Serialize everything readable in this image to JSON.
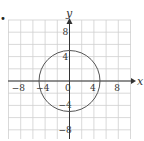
{
  "marker": "•",
  "axes": {
    "x_label": "x",
    "y_label": "y"
  },
  "ticks": {
    "x": [
      {
        "v": -8,
        "label": "−8"
      },
      {
        "v": -4,
        "label": "−4"
      },
      {
        "v": 0,
        "label": "0"
      },
      {
        "v": 4,
        "label": "4"
      },
      {
        "v": 8,
        "label": "8"
      }
    ],
    "y": [
      {
        "v": 8,
        "label": "8"
      },
      {
        "v": 4,
        "label": "4"
      },
      {
        "v": -4,
        "label": "−4"
      },
      {
        "v": -8,
        "label": "−8"
      }
    ]
  },
  "circle": {
    "cx": 0,
    "cy": 0,
    "r": 5,
    "equation": "x^2 + y^2 = 25"
  },
  "grid": {
    "xmin": -10,
    "xmax": 10,
    "ymin": -10,
    "ymax": 10,
    "step": 2
  },
  "colors": {
    "grid": "#cfcfcf",
    "axis": "#333333",
    "circle": "#555555"
  }
}
